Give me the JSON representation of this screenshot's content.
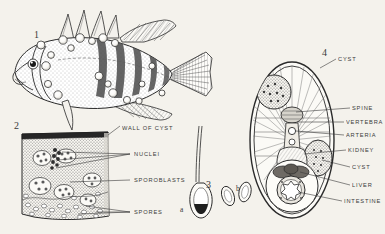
{
  "plate": {
    "background_color": "#f4f2ec",
    "ink_color": "#2b2b2b",
    "label_color": "#3a3a3a"
  },
  "figures": [
    {
      "number": "1",
      "name": "infected-fish-whole",
      "caption": "",
      "x": 34,
      "y": 30
    },
    {
      "number": "2",
      "name": "cyst-tissue-section",
      "caption": "",
      "x": 14,
      "y": 121
    },
    {
      "number": "3",
      "name": "spores",
      "caption": "",
      "x": 206,
      "y": 180
    },
    {
      "number": "4",
      "name": "fish-cross-section",
      "caption": "",
      "x": 322,
      "y": 48
    }
  ],
  "sub_labels": [
    {
      "text": "a",
      "x": 180,
      "y": 206
    },
    {
      "text": "b",
      "x": 236,
      "y": 185
    }
  ],
  "labels_left": [
    {
      "text": "WALL OF CYST",
      "x": 122,
      "y": 125
    },
    {
      "text": "NUCLEI",
      "x": 134,
      "y": 155
    },
    {
      "text": "SPOROBLASTS",
      "x": 134,
      "y": 180
    },
    {
      "text": "SPORES",
      "x": 134,
      "y": 213
    }
  ],
  "labels_right": [
    {
      "text": "CYST",
      "x": 338,
      "y": 61
    },
    {
      "text": "SPINE",
      "x": 352,
      "y": 110
    },
    {
      "text": "VERTEBRA",
      "x": 346,
      "y": 124
    },
    {
      "text": "ARTERIA",
      "x": 346,
      "y": 137
    },
    {
      "text": "KIDNEY",
      "x": 348,
      "y": 152
    },
    {
      "text": "CYST",
      "x": 352,
      "y": 169
    },
    {
      "text": "LIVER",
      "x": 352,
      "y": 187
    },
    {
      "text": "INTESTINE",
      "x": 344,
      "y": 203
    }
  ]
}
